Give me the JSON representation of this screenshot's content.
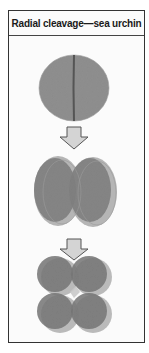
{
  "figure": {
    "title": "Radial cleavage—sea urchin",
    "stages": [
      {
        "name": "one-cell",
        "cells": 1,
        "description": "zygote with first cleavage furrow"
      },
      {
        "name": "two-cell",
        "cells": 2
      },
      {
        "name": "four-cell",
        "cells": 4
      }
    ],
    "arrows": 2,
    "colors": {
      "cell_fill": "#8e8e8e",
      "cell_dark": "#6f6f6f",
      "cell_light": "#b5b5b5",
      "arrow_fill": "#d4d4d4",
      "arrow_stroke": "#555555",
      "border": "#333333"
    }
  }
}
